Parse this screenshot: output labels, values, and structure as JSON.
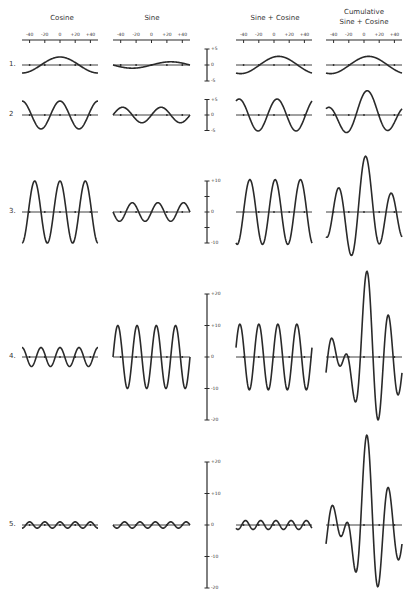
{
  "columns": [
    {
      "id": "cosine",
      "title": [
        "Cosine"
      ],
      "x0": 22,
      "x1": 98
    },
    {
      "id": "sine",
      "title": [
        "Sine"
      ],
      "x0": 113,
      "x1": 190
    },
    {
      "id": "sine_plus_cosine",
      "title": [
        "Sine + Cosine"
      ],
      "x0": 236,
      "x1": 312
    },
    {
      "id": "cumulative",
      "title": [
        "Cumulative",
        "Sine + Cosine"
      ],
      "x0": 326,
      "x1": 402
    }
  ],
  "x_axis": {
    "y": 40,
    "ticks": [
      -40,
      -20,
      0,
      20,
      40
    ],
    "tick_labels": [
      "-40",
      "-20",
      "0",
      "+20",
      "+40"
    ],
    "range": [
      -50,
      50
    ]
  },
  "rows": [
    {
      "label": "1.",
      "baseline": 65,
      "px_per_unit": 3.2,
      "scale": {
        "labels": [
          "+5",
          "0",
          "-5"
        ],
        "values": [
          5,
          0,
          -5
        ]
      },
      "cos": {
        "amp": 2.5,
        "period": 100
      },
      "sin": {
        "amp": 1.0,
        "period": 100
      }
    },
    {
      "label": "2",
      "baseline": 115,
      "px_per_unit": 3.1,
      "scale": {
        "labels": [
          "+5",
          "0",
          "-5"
        ],
        "values": [
          5,
          0,
          -5
        ]
      },
      "cos": {
        "amp": 4.5,
        "period": 50
      },
      "sin": {
        "amp": 2.5,
        "period": 50
      }
    },
    {
      "label": "3.",
      "baseline": 212,
      "px_per_unit": 3.1,
      "scale": {
        "labels": [
          "+10",
          "",
          "0",
          "",
          "-10"
        ],
        "values": [
          10,
          5,
          0,
          -5,
          -10
        ]
      },
      "cos": {
        "amp": 10,
        "period": 33.3
      },
      "sin": {
        "amp": 3,
        "period": 33.3
      }
    },
    {
      "label": "4.",
      "baseline": 357,
      "px_per_unit": 3.15,
      "scale": {
        "labels": [
          "+20",
          "+10",
          "0",
          "-10",
          "-20"
        ],
        "values": [
          20,
          10,
          0,
          -10,
          -20
        ]
      },
      "cos": {
        "amp": 3,
        "period": 25
      },
      "sin": {
        "amp": 10,
        "period": 25
      }
    },
    {
      "label": "5.",
      "baseline": 525,
      "px_per_unit": 3.15,
      "scale": {
        "labels": [
          "+20",
          "+10",
          "0",
          "-10",
          "-20"
        ],
        "values": [
          20,
          10,
          0,
          -10,
          -20
        ]
      },
      "cos": {
        "amp": 1,
        "period": 20
      },
      "sin": {
        "amp": 1,
        "period": 20
      }
    }
  ],
  "scale_bar_x": 207,
  "colors": {
    "ink": "#2a2a2a",
    "paper": "#ffffff"
  }
}
